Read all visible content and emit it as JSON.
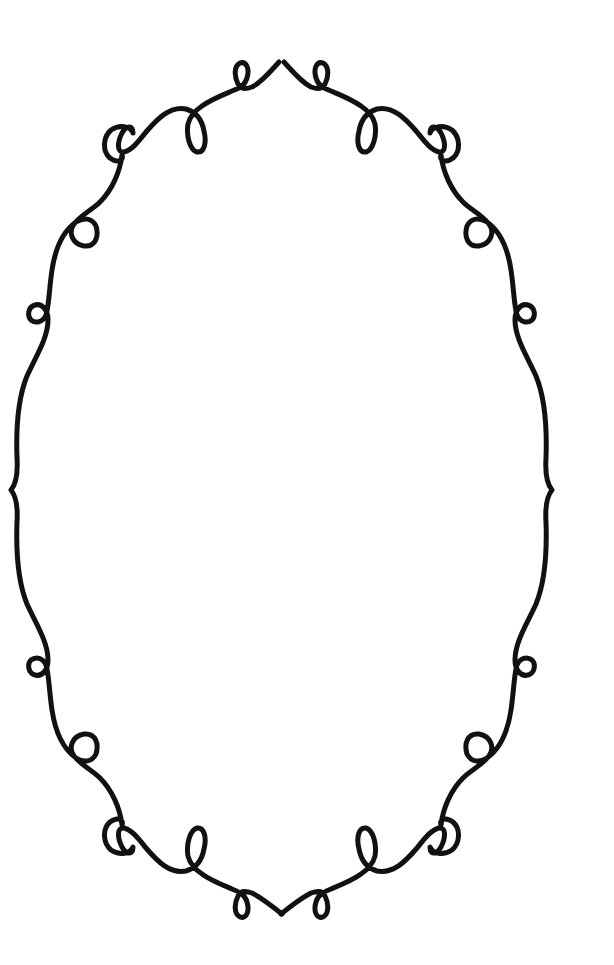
{
  "image": {
    "description": "Decorative ornamental oval frame with looped flourishes on a white background",
    "background_color": "#ffffff",
    "stroke_color": "#111111",
    "stroke_width": 5
  },
  "frame": {
    "shape": "oval",
    "loops_count": 16,
    "peaks": [
      "top",
      "bottom"
    ],
    "side_notches": [
      "left",
      "right"
    ]
  }
}
